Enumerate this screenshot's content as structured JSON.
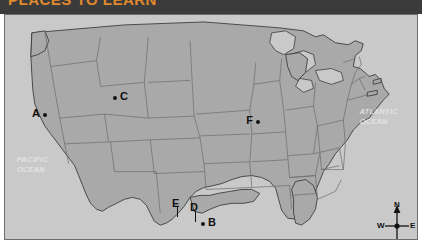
{
  "title_bar": {
    "title": "PLACES TO LEARN"
  },
  "map": {
    "caption_alt": "Outline map of the contiguous United States with state boundaries",
    "colors": {
      "land": "#a9a9a9",
      "ocean": "#c9c9c9",
      "state_border": "#6b6b6b",
      "coastline": "#3d3d3d",
      "frame_border": "#6e6e6e",
      "title_bar_background": "#3b3b3b",
      "title_text": "#e08a2e",
      "marker": "#141414",
      "ocean_label": "#e2e2e2"
    },
    "ocean_labels": [
      {
        "name": "pacific-ocean",
        "line1": "PACIFIC",
        "line2": "OCEAN"
      },
      {
        "name": "atlantic-ocean",
        "line1": "ATLANTIC",
        "line2": "OCEAN"
      }
    ],
    "points": [
      {
        "id": "A",
        "label": "A",
        "x": 40,
        "y": 114,
        "label_position": "left"
      },
      {
        "id": "B",
        "label": "B",
        "x": 202,
        "y": 222,
        "label_position": "right"
      },
      {
        "id": "C",
        "label": "C",
        "x": 110,
        "y": 97,
        "label_position": "right"
      },
      {
        "id": "D",
        "label": "D",
        "x": 189,
        "y": 217,
        "label_position": "above"
      },
      {
        "id": "E",
        "label": "E",
        "x": 171,
        "y": 214,
        "label_position": "above"
      },
      {
        "id": "F",
        "label": "F",
        "x": 253,
        "y": 121,
        "label_position": "left"
      }
    ],
    "compass": {
      "north": "N",
      "south": "S",
      "west": "W",
      "east": "E"
    }
  }
}
